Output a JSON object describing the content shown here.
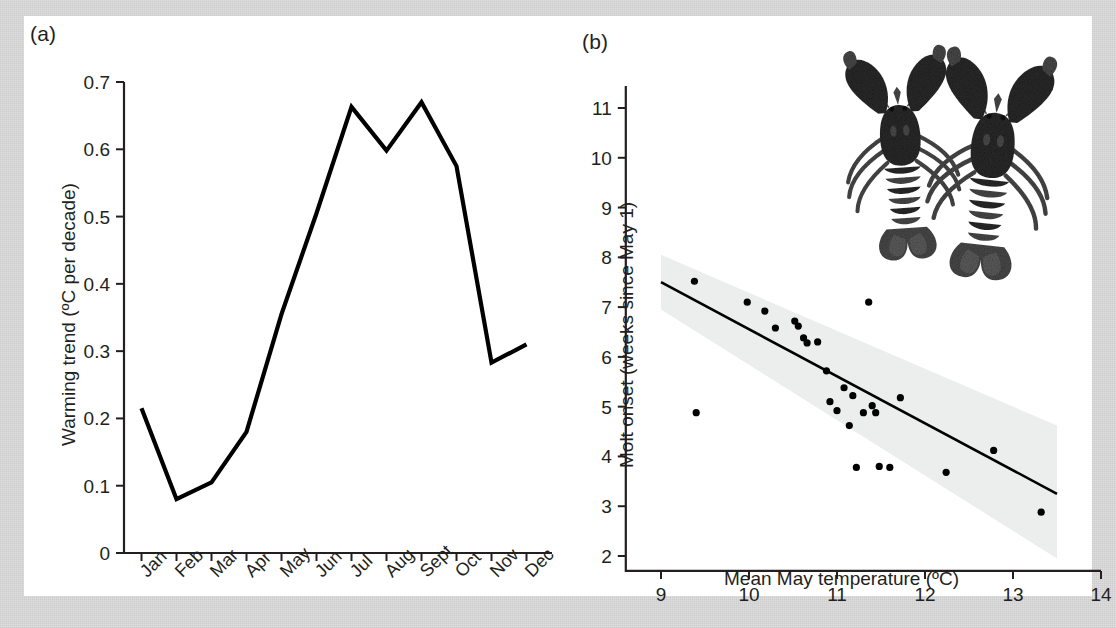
{
  "figure": {
    "panel_a_label": "(a)",
    "panel_b_label": "(b)"
  },
  "chart_data": [
    {
      "panel": "(a)",
      "type": "line",
      "title": "",
      "xlabel": "",
      "ylabel": "Warming trend (ºC per decade)",
      "categories": [
        "Jan",
        "Feb",
        "Mar",
        "Apr",
        "May",
        "Jun",
        "Jul",
        "Aug",
        "Sept",
        "Oct",
        "Nov",
        "Dec"
      ],
      "values": [
        0.215,
        0.08,
        0.105,
        0.18,
        0.355,
        0.505,
        0.663,
        0.598,
        0.67,
        0.575,
        0.283,
        0.31
      ],
      "ylim": [
        0,
        0.7
      ],
      "yticks": [
        "0",
        "0.1",
        "0.2",
        "0.3",
        "0.4",
        "0.5",
        "0.6",
        "0.7"
      ],
      "ytick_values": [
        0,
        0.1,
        0.2,
        0.3,
        0.4,
        0.5,
        0.6,
        0.7
      ],
      "grid": false,
      "legend": "none",
      "line_color": "#000000"
    },
    {
      "panel": "(b)",
      "type": "scatter",
      "title": "",
      "xlabel": "Mean May temperature (ºC)",
      "ylabel": "Molt onset (weeks since May 1)",
      "xlim": [
        8.6,
        14.0
      ],
      "ylim": [
        1.7,
        11.4
      ],
      "xticks": [
        "9",
        "10",
        "11",
        "12",
        "13",
        "14"
      ],
      "xtick_values": [
        9,
        10,
        11,
        12,
        13,
        14
      ],
      "yticks": [
        "2",
        "3",
        "4",
        "5",
        "6",
        "7",
        "8",
        "9",
        "10",
        "11"
      ],
      "ytick_values": [
        2,
        3,
        4,
        5,
        6,
        7,
        8,
        9,
        10,
        11
      ],
      "grid": false,
      "legend": "none",
      "point_color": "#000000",
      "points": [
        [
          9.38,
          7.52
        ],
        [
          9.4,
          4.88
        ],
        [
          9.98,
          7.1
        ],
        [
          10.18,
          6.92
        ],
        [
          10.3,
          6.58
        ],
        [
          10.52,
          6.72
        ],
        [
          10.56,
          6.62
        ],
        [
          10.62,
          6.38
        ],
        [
          10.66,
          6.28
        ],
        [
          10.78,
          6.3
        ],
        [
          10.88,
          5.72
        ],
        [
          10.92,
          5.1
        ],
        [
          11.0,
          4.92
        ],
        [
          11.08,
          5.38
        ],
        [
          11.14,
          4.62
        ],
        [
          11.18,
          5.22
        ],
        [
          11.22,
          3.78
        ],
        [
          11.3,
          4.88
        ],
        [
          11.36,
          7.1
        ],
        [
          11.4,
          5.02
        ],
        [
          11.44,
          4.88
        ],
        [
          11.48,
          3.8
        ],
        [
          11.6,
          3.78
        ],
        [
          11.72,
          5.18
        ],
        [
          12.24,
          3.68
        ],
        [
          12.78,
          4.12
        ],
        [
          13.32,
          2.88
        ]
      ],
      "regression_line": {
        "x": [
          9.0,
          13.5
        ],
        "y": [
          7.5,
          3.25
        ],
        "color": "#000000"
      },
      "confidence_band": {
        "color": "#eceded",
        "x": [
          9.0,
          13.5
        ],
        "upper": [
          8.05,
          4.62
        ],
        "lower": [
          6.95,
          1.95
        ]
      },
      "inset_image": {
        "name": "two-lobsters-photo",
        "description": "Photograph of two lobsters"
      }
    }
  ]
}
